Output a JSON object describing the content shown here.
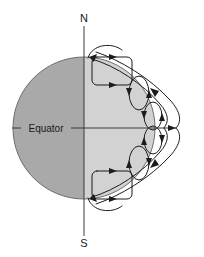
{
  "figure": {
    "width": 204,
    "height": 257,
    "background_color": "#ffffff"
  },
  "labels": {
    "north_pole": "N",
    "south_pole": "S",
    "equator": "Equator"
  },
  "colors": {
    "planet_dark_hemisphere": "#a9a9a9",
    "planet_light_hemisphere": "#d2d2d2",
    "outline": "#6e6e6e",
    "field_line": "#1c1c1c",
    "axis_line": "#3a3a3a",
    "text": "#1a1a1a"
  },
  "planet": {
    "center_x": 84,
    "center_y": 128,
    "radius": 71,
    "terminator_x": 84
  },
  "axis": {
    "x": 84,
    "top_y": 26,
    "bottom_y": 236,
    "north_label_x": 84,
    "north_label_y": 20,
    "south_label_x": 84,
    "south_label_y": 246
  },
  "equator": {
    "y": 128,
    "start_x": 12,
    "end_x": 176,
    "label_x": 46,
    "label_y": 131
  },
  "field_structures": {
    "flux_rectangles": [
      {
        "name": "northern-flux-loop",
        "x": 92,
        "y": 57,
        "width": 40,
        "height": 28,
        "corner_radius": 5
      },
      {
        "name": "southern-flux-loop",
        "x": 92,
        "y": 171,
        "width": 40,
        "height": 28,
        "corner_radius": 5
      }
    ],
    "small_loops": [
      {
        "name": "north-outer-loop",
        "cx": 139,
        "cy": 93,
        "rx": 10,
        "ry": 17
      },
      {
        "name": "north-inner-loop",
        "cx": 153,
        "cy": 116,
        "rx": 9,
        "ry": 14
      },
      {
        "name": "south-inner-loop",
        "cx": 153,
        "cy": 140,
        "rx": 9,
        "ry": 14
      },
      {
        "name": "south-outer-loop",
        "cx": 139,
        "cy": 163,
        "rx": 10,
        "ry": 17
      }
    ],
    "outer_field_lines": [
      {
        "name": "north-outer-field-line"
      },
      {
        "name": "south-outer-field-line"
      }
    ],
    "cusp_arcs": [
      {
        "name": "north-polar-cusp-arc"
      },
      {
        "name": "south-polar-cusp-arc"
      }
    ]
  }
}
